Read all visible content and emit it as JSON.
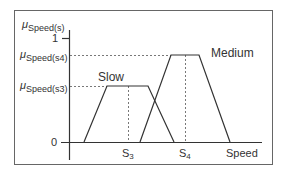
{
  "diagram": {
    "y_axis": {
      "title_mu": "μ",
      "title_sub": "Speed(s)",
      "ticks": [
        {
          "mu": "μ",
          "sub": "Speed(s4)"
        },
        {
          "mu": "μ",
          "sub": "Speed(s3)"
        }
      ],
      "one_label": "1",
      "zero_label": "0"
    },
    "x_axis": {
      "label": "Speed",
      "ticks": [
        {
          "base": "S",
          "sub": "3"
        },
        {
          "base": "S",
          "sub": "4"
        }
      ]
    },
    "sets": [
      {
        "name": "Slow"
      },
      {
        "name": "Medium"
      }
    ],
    "colors": {
      "line": "#333333",
      "frame": "#555555"
    }
  }
}
